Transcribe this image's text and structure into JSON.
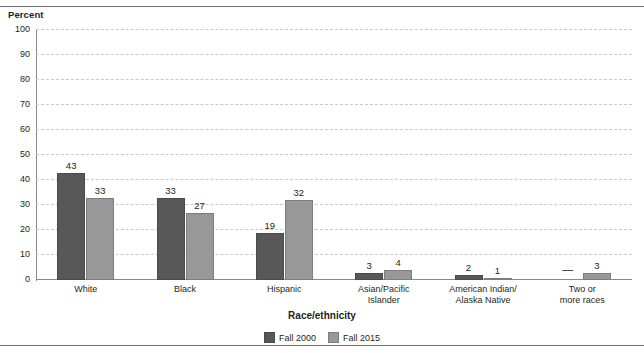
{
  "axis_titles": {
    "y": "Percent",
    "x": "Race/ethnicity"
  },
  "legend": {
    "items": [
      {
        "label": "Fall 2000",
        "color": "#585858"
      },
      {
        "label": "Fall 2015",
        "color": "#989898"
      }
    ]
  },
  "chart_data": {
    "type": "bar",
    "title": "",
    "xlabel": "Race/ethnicity",
    "ylabel": "Percent",
    "ylim": [
      0,
      100
    ],
    "ytick_labels": [
      "100",
      "90",
      "80",
      "70",
      "60",
      "50",
      "40",
      "30",
      "20",
      "10",
      "0"
    ],
    "ytick_values": [
      100,
      90,
      80,
      70,
      60,
      50,
      40,
      30,
      20,
      10,
      0
    ],
    "grid": "horizontal-dashed",
    "legend_position": "bottom-center",
    "categories": [
      "White",
      "Black",
      "Hispanic",
      "Asian/Pacific\nIslander",
      "American Indian/\nAlaska Native",
      "Two or\nmore races"
    ],
    "series": [
      {
        "name": "Fall 2000",
        "color": "#585858",
        "values": [
          43,
          33,
          19,
          3,
          2,
          null
        ],
        "labels": [
          "43",
          "33",
          "19",
          "3",
          "2",
          "—"
        ]
      },
      {
        "name": "Fall 2015",
        "color": "#989898",
        "values": [
          33,
          27,
          32,
          4,
          1,
          3
        ],
        "labels": [
          "33",
          "27",
          "32",
          "4",
          "1",
          "3"
        ]
      }
    ]
  }
}
